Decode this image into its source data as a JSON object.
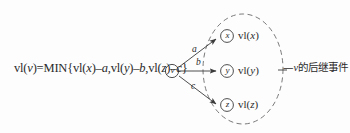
{
  "figure": {
    "type": "node-link-diagram",
    "background_color": "#fdfdfd",
    "stroke_color": "#3a3a3a",
    "text_color": "#2b2b2b"
  },
  "formula": {
    "full_text": "vl(v)=MIN{vl(x)–a,vl(y)–b,vl(z)–c}",
    "prefix": "vl(",
    "subject": "v",
    "middle": ")=MIN{vl(",
    "term1_var": "x",
    "term1_weight": "a",
    "term2_var": "y",
    "term2_weight": "b",
    "term3_var": "z",
    "term3_weight": "c",
    "part_a": "vl(",
    "part_b": ")=MIN{vl(",
    "part_c": ")–",
    "part_d": ",vl(",
    "part_e": ")–",
    "part_f": ",vl(",
    "part_g": ")–",
    "part_h": "}"
  },
  "nodes": {
    "source": {
      "id": "v",
      "label": "v"
    },
    "targets": [
      {
        "id": "x",
        "label": "x",
        "value_label_prefix": "vl(",
        "value_label_var": "x",
        "value_label_suffix": ")"
      },
      {
        "id": "y",
        "label": "y",
        "value_label_prefix": "vl(",
        "value_label_var": "y",
        "value_label_suffix": ")"
      },
      {
        "id": "z",
        "label": "z",
        "value_label_prefix": "vl(",
        "value_label_var": "z",
        "value_label_suffix": ")"
      }
    ]
  },
  "edges": [
    {
      "from": "v",
      "to": "x",
      "weight": "a"
    },
    {
      "from": "v",
      "to": "y",
      "weight": "b"
    },
    {
      "from": "v",
      "to": "z",
      "weight": "c"
    }
  ],
  "annotation": {
    "dash": "—",
    "subject": "v",
    "text": "的后继事件",
    "full_text": "—v的后继事件"
  },
  "grouping": {
    "shape": "dashed-ellipse",
    "encloses": [
      "x",
      "y",
      "z"
    ]
  }
}
